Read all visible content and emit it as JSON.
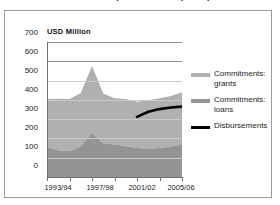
{
  "title": "1993-2006 (2005 constant prices)",
  "axis": {
    "ylabel": "USD Million",
    "yticks": [
      "700",
      "600",
      "500",
      "400",
      "300",
      "200",
      "100",
      "0"
    ],
    "xticks": [
      "1993/94",
      "1997/98",
      "2001/02",
      "2005/06"
    ]
  },
  "legend": {
    "items": [
      {
        "label_line1": "Commitments:",
        "label_line2": "grants",
        "color": "#b0b0b0",
        "type": "area"
      },
      {
        "label_line1": "Commitments:",
        "label_line2": "loans",
        "color": "#949494",
        "type": "area"
      },
      {
        "label_line1": "Disbursements",
        "label_line2": "",
        "color": "#000000",
        "type": "line"
      }
    ]
  },
  "chart_data": {
    "type": "area",
    "title": "1993-2006 (2005 constant prices)",
    "xlabel": "",
    "ylabel": "USD Million",
    "ylim": [
      0,
      700
    ],
    "grid": true,
    "legend_position": "right",
    "stacked": true,
    "categories": [
      "1993/94",
      "1994/95",
      "1995/96",
      "1996/97",
      "1997/98",
      "1998/99",
      "1999/00",
      "2000/01",
      "2001/02",
      "2002/03",
      "2003/04",
      "2004/05",
      "2005/06"
    ],
    "series": [
      {
        "name": "Commitments: loans",
        "color": "#949494",
        "values": [
          155,
          138,
          133,
          160,
          230,
          175,
          168,
          160,
          150,
          148,
          150,
          158,
          168
        ]
      },
      {
        "name": "Commitments: grants",
        "color": "#b0b0b0",
        "values": [
          250,
          268,
          272,
          275,
          345,
          258,
          240,
          245,
          240,
          250,
          258,
          262,
          272
        ]
      },
      {
        "name": "Disbursements",
        "color": "#000000",
        "type": "line",
        "x": [
          "2001/02",
          "2002/03",
          "2003/04",
          "2004/05",
          "2005/06"
        ],
        "values": [
          312,
          338,
          352,
          360,
          365
        ]
      }
    ],
    "stack_totals": [
      405,
      406,
      405,
      435,
      575,
      433,
      408,
      405,
      390,
      398,
      408,
      420,
      440
    ]
  }
}
